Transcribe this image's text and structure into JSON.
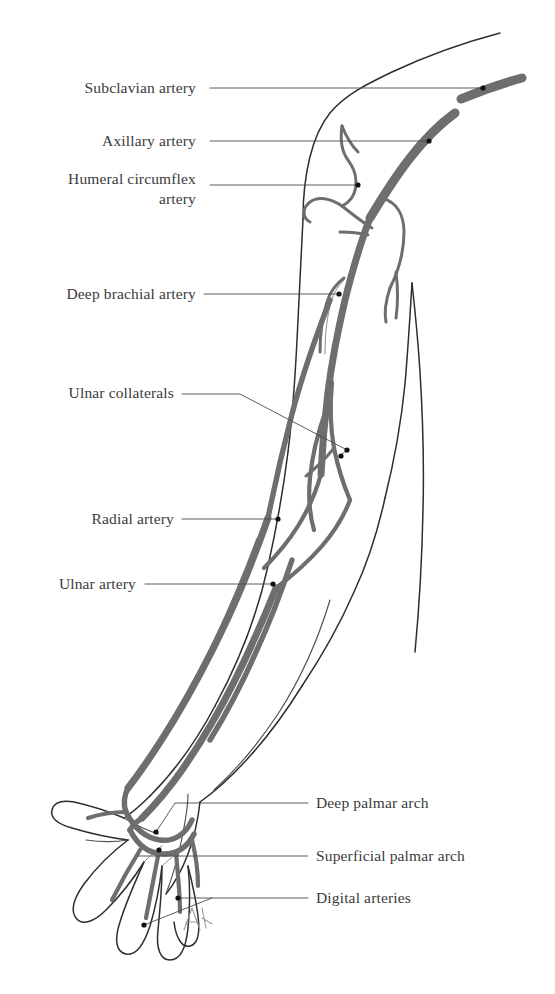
{
  "figure": {
    "background_color": "#ffffff",
    "artery_color": "#6e6e6e",
    "outline_color": "#2e2e2e",
    "label_color": "#3b3b3b",
    "leader_color": "#4a4a4a"
  },
  "labels": [
    {
      "id": "subclavian-artery",
      "text": "Subclavian artery",
      "text_x": 196,
      "text_y": 93,
      "anchor": "end",
      "leader_start_x": 210,
      "leader_start_y": 88,
      "leader_end_x": 483,
      "leader_end_y": 88,
      "dot_x": 483,
      "dot_y": 88
    },
    {
      "id": "axillary-artery",
      "text": "Axillary artery",
      "text_x": 196,
      "text_y": 146,
      "anchor": "end",
      "leader_start_x": 210,
      "leader_start_y": 141,
      "leader_end_x": 429,
      "leader_end_y": 141,
      "dot_x": 429,
      "dot_y": 141
    },
    {
      "id": "humeral-circumflex-artery",
      "text": "Humeral circumflex",
      "text_line2": "artery",
      "text_x": 196,
      "text_y": 184,
      "text2_x": 196,
      "text2_y": 204,
      "anchor": "end",
      "leader_start_x": 210,
      "leader_start_y": 185,
      "leader_end_x": 358,
      "leader_end_y": 185,
      "dot_x": 358,
      "dot_y": 185
    },
    {
      "id": "deep-brachial-artery",
      "text": "Deep brachial artery",
      "text_x": 196,
      "text_y": 299,
      "anchor": "end",
      "leader_start_x": 204,
      "leader_start_y": 294,
      "leader_end_x": 339,
      "leader_end_y": 294,
      "dot_x": 339,
      "dot_y": 294
    },
    {
      "id": "ulnar-collaterals",
      "text": "Ulnar collaterals",
      "text_x": 174,
      "text_y": 398,
      "anchor": "end",
      "dot_x": 347,
      "dot_y": 450,
      "dot2_x": 341,
      "dot2_y": 455
    },
    {
      "id": "radial-artery",
      "text": "Radial artery",
      "text_x": 174,
      "text_y": 524,
      "anchor": "end",
      "leader_start_x": 182,
      "leader_start_y": 519,
      "leader_end_x": 278,
      "leader_end_y": 519,
      "dot_x": 278,
      "dot_y": 519
    },
    {
      "id": "ulnar-artery",
      "text": "Ulnar artery",
      "text_x": 136,
      "text_y": 589,
      "anchor": "end",
      "leader_start_x": 145,
      "leader_start_y": 584,
      "leader_end_x": 273,
      "leader_end_y": 584,
      "dot_x": 273,
      "dot_y": 584
    },
    {
      "id": "deep-palmar-arch",
      "text": "Deep palmar arch",
      "text_x": 316,
      "text_y": 808,
      "anchor": "start",
      "leader_start_x": 308,
      "leader_start_y": 803,
      "leader_end_x": 160,
      "leader_end_y": 803,
      "dot_x": 156,
      "dot_y": 832
    },
    {
      "id": "superficial-palmar-arch",
      "text": "Superficial palmar arch",
      "text_x": 316,
      "text_y": 861,
      "anchor": "start",
      "leader_start_x": 308,
      "leader_start_y": 856,
      "leader_end_x": 138,
      "leader_end_y": 856,
      "dot_x": 159,
      "dot_y": 849
    },
    {
      "id": "digital-arteries",
      "text": "Digital arteries",
      "text_x": 316,
      "text_y": 903,
      "anchor": "start",
      "leader_start_x": 308,
      "leader_start_y": 898,
      "leader_end_x": 178,
      "leader_end_y": 898,
      "dot_x": 178,
      "dot_y": 898,
      "dot2_x": 144,
      "dot2_y": 925
    }
  ],
  "artist_signature": "AN"
}
